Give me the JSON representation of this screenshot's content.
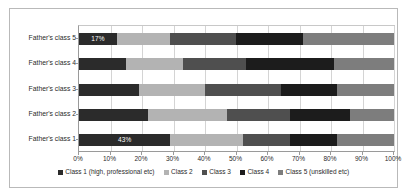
{
  "chart_data": {
    "type": "bar",
    "orientation": "horizontal",
    "stacked": "100%",
    "title": "",
    "subtitle": "",
    "xlabel": "",
    "ylabel": "",
    "xlim": [
      0,
      100
    ],
    "grid": true,
    "legend_position": "bottom",
    "categories": [
      "Father's class 1",
      "Father's class 2",
      "Father's class 3",
      "Father's class 4",
      "Father's class 5"
    ],
    "category_order_top_to_bottom": [
      "Father's class 5",
      "Father's class 4",
      "Father's class 3",
      "Father's class 2",
      "Father's class 1"
    ],
    "series": [
      {
        "name": "Class 1 (high, professional etc)",
        "color": "#2b2b2b",
        "values": [
          29,
          22,
          19,
          15,
          12
        ]
      },
      {
        "name": "Class 2",
        "color": "#b3b3b3",
        "values": [
          23,
          25,
          21,
          18,
          17
        ]
      },
      {
        "name": "Class 3",
        "color": "#4f4f4f",
        "values": [
          15,
          20,
          24,
          20,
          21
        ]
      },
      {
        "name": "Class 4",
        "color": "#1c1c1c",
        "values": [
          15,
          19,
          18,
          28,
          21
        ]
      },
      {
        "name": "Class 5 (unskilled etc)",
        "color": "#7d7d7d",
        "values": [
          18,
          14,
          18,
          19,
          29
        ]
      }
    ],
    "data_labels": [
      {
        "category": "Father's class 1",
        "series": "Class 1 (high, professional etc)",
        "text": "43%"
      },
      {
        "category": "Father's class 5",
        "series": "Class 1 (high, professional etc)",
        "text": "17%"
      }
    ],
    "xtick_labels": [
      "0%",
      "10%",
      "20%",
      "30%",
      "40%",
      "50%",
      "60%",
      "70%",
      "80%",
      "90%",
      "100%"
    ],
    "xtick_values": [
      0,
      10,
      20,
      30,
      40,
      50,
      60,
      70,
      80,
      90,
      100
    ],
    "legend_entries": [
      "Class 1 (high, professional etc)",
      "Class 2",
      "Class 3",
      "Class 4",
      "Class 5 (unskilled etc)"
    ]
  }
}
